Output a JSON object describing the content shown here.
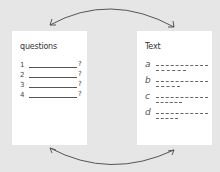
{
  "diagram": {
    "left_card": {
      "title": "questions",
      "items": [
        {
          "number": "1",
          "mark": "?"
        },
        {
          "number": "2",
          "mark": "?"
        },
        {
          "number": "3",
          "mark": "?"
        },
        {
          "number": "4",
          "mark": "?"
        }
      ]
    },
    "right_card": {
      "title": "Text",
      "items": [
        {
          "letter": "a"
        },
        {
          "letter": "b"
        },
        {
          "letter": "c"
        },
        {
          "letter": "d"
        }
      ]
    },
    "arrows": [
      "top-curved-double-arrow",
      "bottom-curved-double-arrow"
    ],
    "colors": {
      "background": "#e6e6e6",
      "card": "#ffffff",
      "ink": "#444444"
    }
  }
}
